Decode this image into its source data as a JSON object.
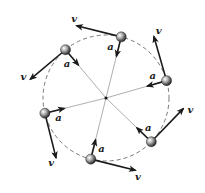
{
  "diagram": {
    "velocity_label": "v",
    "acceleration_label": "a",
    "colors": {
      "ink": "#1a1a1a",
      "circle": "#555555",
      "ball_light": "#ffffff",
      "ball_dark": "#333333"
    },
    "particle_count": 6
  }
}
